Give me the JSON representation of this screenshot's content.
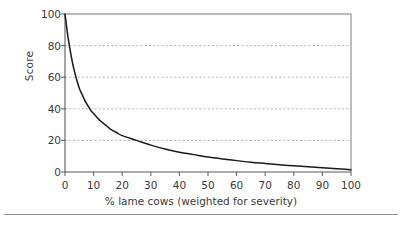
{
  "chart_data": {
    "type": "line",
    "title": "",
    "xlabel": "% lame cows (weighted for severity)",
    "ylabel": "Score",
    "xlim": [
      0,
      100
    ],
    "ylim": [
      0,
      100
    ],
    "x_ticks": [
      0,
      10,
      20,
      30,
      40,
      50,
      60,
      70,
      80,
      90,
      100
    ],
    "y_ticks": [
      0,
      20,
      40,
      60,
      80,
      100
    ],
    "grid": "horizontal-dotted",
    "gridlines_y": [
      20,
      40,
      60,
      80
    ],
    "legend": "none",
    "series": [
      {
        "name": "Score vs % lame cows",
        "color": "#1a1a1a",
        "x": [
          0,
          1,
          2,
          3,
          4,
          5,
          6,
          7,
          8,
          9,
          10,
          12,
          14,
          16,
          18,
          20,
          25,
          30,
          35,
          40,
          45,
          50,
          55,
          60,
          65,
          70,
          75,
          80,
          85,
          90,
          95,
          100
        ],
        "y": [
          100,
          86,
          75,
          66,
          59,
          53,
          49,
          45,
          42,
          39,
          37,
          33,
          30,
          27,
          25,
          23,
          20,
          17,
          14.5,
          12.5,
          11,
          9.5,
          8.3,
          7.2,
          6.2,
          5.4,
          4.6,
          3.9,
          3.3,
          2.7,
          2.1,
          1.5
        ]
      }
    ]
  },
  "axes": {
    "y_tick_labels": [
      "100",
      "80",
      "60",
      "40",
      "20",
      "0"
    ],
    "x_tick_labels": [
      "0",
      "10",
      "20",
      "30",
      "40",
      "50",
      "60",
      "70",
      "80",
      "90",
      "100"
    ],
    "y_axis_title": "Score",
    "x_axis_title": "% lame cows (weighted for severity)"
  },
  "colors": {
    "curve": "#1a1a1a",
    "axis": "#595959",
    "frame": "#7a7a7a",
    "grid": "#b5b5b5",
    "text": "#3a3a3a",
    "rule": "#8c8c8c",
    "background": "#ffffff"
  }
}
